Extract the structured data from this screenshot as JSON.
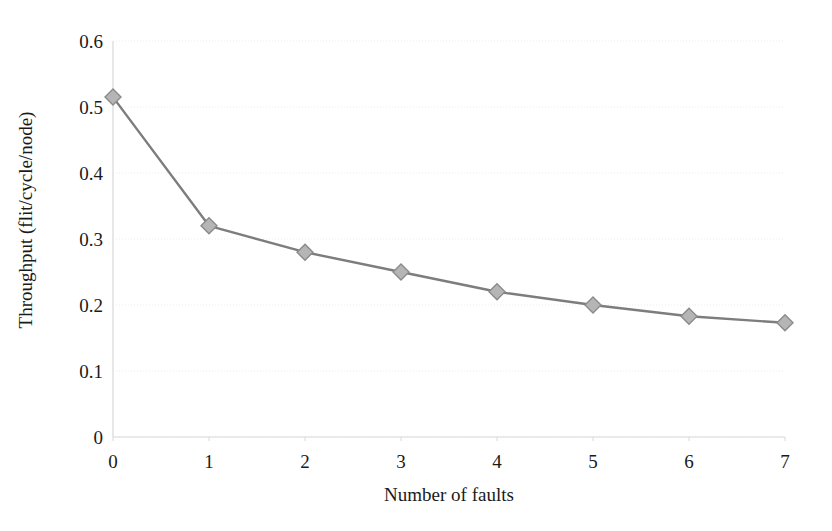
{
  "chart_data": {
    "type": "line",
    "title": "",
    "subtitle": "",
    "xlabel": "Number of faults",
    "ylabel": "Throughput (flit/cycle/node)",
    "x": [
      0,
      1,
      2,
      3,
      4,
      5,
      6,
      7
    ],
    "values": [
      0.515,
      0.32,
      0.28,
      0.25,
      0.22,
      0.2,
      0.183,
      0.173
    ],
    "series": [
      {
        "name": "Throughput",
        "values": [
          0.515,
          0.32,
          0.28,
          0.25,
          0.22,
          0.2,
          0.183,
          0.173
        ]
      }
    ],
    "xlim": [
      0,
      7
    ],
    "ylim": [
      0,
      0.6
    ],
    "xticks": [
      "0",
      "1",
      "2",
      "3",
      "4",
      "5",
      "6",
      "7"
    ],
    "yticks": [
      "0",
      "0.1",
      "0.2",
      "0.3",
      "0.4",
      "0.5",
      "0.6"
    ],
    "ytick_values": [
      0,
      0.1,
      0.2,
      0.3,
      0.4,
      0.5,
      0.6
    ],
    "grid": "horizontal-dotted-faint",
    "legend": "none",
    "marker": "diamond",
    "line_color": "#7d7d7d",
    "marker_fill": "#b5b5b5",
    "marker_stroke": "#8a8a8a",
    "grid_color": "#ededed",
    "axis_color": "#d8d8d8",
    "background": "#ffffff"
  },
  "axes": {
    "y_title": "Throughput (flit/cycle/node)",
    "x_title": "Number of faults"
  }
}
